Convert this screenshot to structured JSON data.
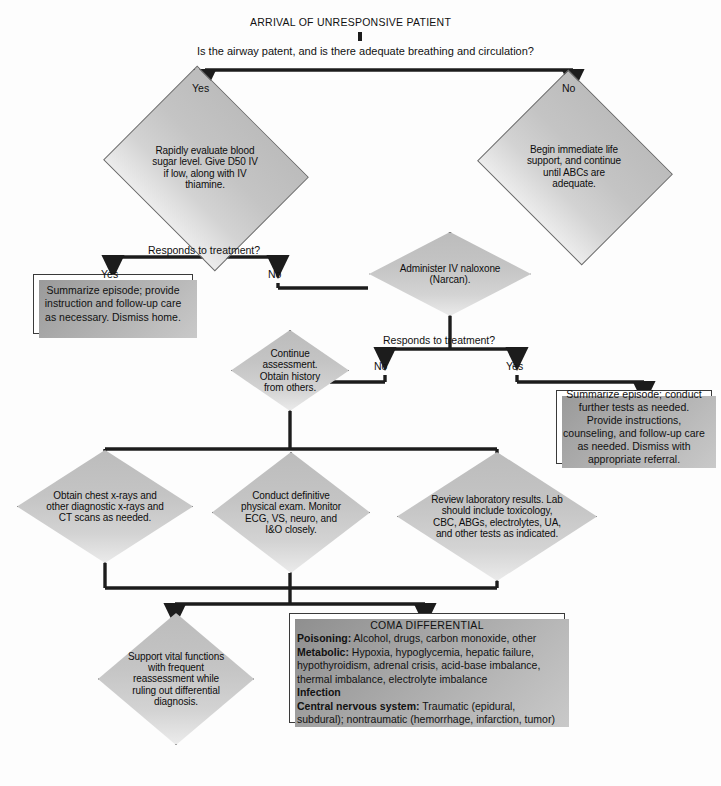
{
  "title": "ARRIVAL OF UNRESPONSIVE PATIENT",
  "question_top": "Is the airway patent, and is there adequate breathing and circulation?",
  "labels": {
    "yes": "Yes",
    "no": "No",
    "responds": "Responds to treatment?"
  },
  "nodes": {
    "blood_sugar": "Rapidly evaluate blood sugar level. Give D50 IV if low, along with IV thiamine.",
    "life_support": "Begin immediate life support, and continue until ABCs are adequate.",
    "naloxone": "Administer IV naloxone (Narcan).",
    "continue_assessment": "Continue assessment. Obtain history from others.",
    "summarize_left": "Summarize episode; provide instruction and follow-up care as necessary. Dismiss home.",
    "summarize_right": "Summarize episode; conduct further tests as needed. Provide instructions, counseling, and follow-up care as needed. Dismiss with appropriate referral.",
    "xrays": "Obtain chest x-rays and other diagnostic x-rays and CT scans as needed.",
    "physical_exam": "Conduct definitive physical exam. Monitor ECG, VS, neuro, and I&O closely.",
    "labs": "Review laboratory results. Lab should include toxicology, CBC, ABGs, electrolytes, UA, and other tests as indicated.",
    "support_vital": "Support vital functions with frequent reassessment while ruling out differential diagnosis."
  },
  "differential": {
    "title": "COMA DIFFERENTIAL",
    "rows": [
      {
        "head": "Poisoning:",
        "body": " Alcohol, drugs, carbon monoxide, other"
      },
      {
        "head": "Metabolic:",
        "body": " Hypoxia, hypoglycemia, hepatic failure,"
      },
      {
        "head": "",
        "body": "hypothyroidism, adrenal crisis, acid-base imbalance,"
      },
      {
        "head": "",
        "body": "thermal imbalance, electrolyte imbalance"
      },
      {
        "head": "Infection",
        "body": ""
      },
      {
        "head": "Central nervous system:",
        "body": " Traumatic (epidural,"
      },
      {
        "head": "",
        "body": "subdural); nontraumatic (hemorrhage, infarction, tumor)"
      }
    ]
  },
  "branch_labels": {
    "top_yes": "Yes",
    "top_no": "No",
    "sugar_yes": "Yes",
    "sugar_no": "No",
    "sugar_q": "Responds to treatment?",
    "nalox_q": "Responds to treatment?",
    "nalox_no": "No",
    "nalox_yes": "Yes"
  },
  "colors": {
    "diamond_fill": "#c4c4c4",
    "diamond_stroke": "#6a6a6a",
    "line": "#1c1c1c",
    "box_fill": "#ffffff",
    "box_stroke": "#3a3a3a",
    "page_bg": "#fdfdfd"
  }
}
